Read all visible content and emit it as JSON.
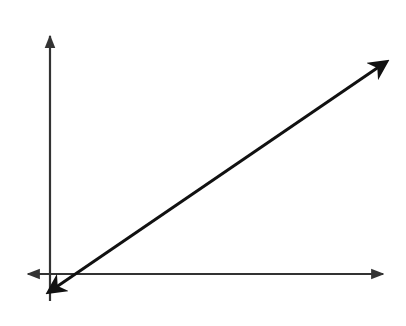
{
  "diagram": {
    "type": "coordinate-grid",
    "grid": {
      "columns": 14,
      "rows": 10,
      "x_range": [
        -1,
        13
      ],
      "y_range": [
        -1,
        9
      ]
    },
    "axes": {
      "x_label": "x",
      "y_label": "y",
      "origin_label": "O"
    },
    "line": {
      "description": "line through Z, Y, X, W with arrows at both ends",
      "slope": 0.6667
    },
    "points": [
      {
        "label": "Z",
        "x": 1,
        "y": 0
      },
      {
        "label": "Y",
        "x": 4,
        "y": 2
      },
      {
        "label": "X",
        "x": 7,
        "y": 4
      },
      {
        "label": "W",
        "x": 10,
        "y": 6
      }
    ],
    "shaded_steps": [
      {
        "x_from": 1,
        "x_to": 4,
        "height": 2
      },
      {
        "x_from": 4,
        "x_to": 7,
        "height": 4
      },
      {
        "x_from": 7,
        "x_to": 10,
        "height": 6
      }
    ],
    "colors": {
      "grid": "#6e6e6e",
      "shade": "#6b6b6b",
      "line": "#111111",
      "background": "#ffffff"
    }
  }
}
